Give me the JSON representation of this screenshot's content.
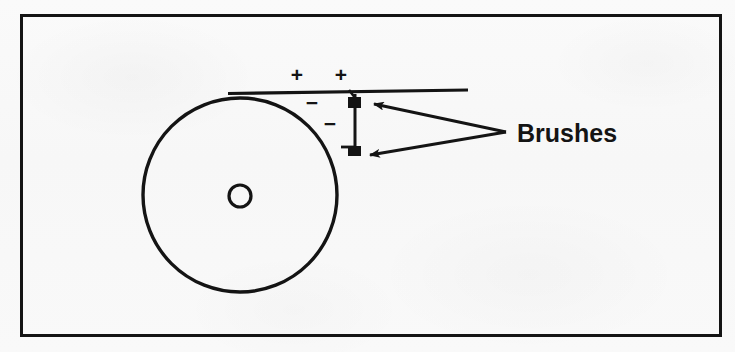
{
  "figure": {
    "kind": "technical-line-drawing",
    "background_color": "#f8f8f8",
    "ink_color": "#141414",
    "frame": {
      "name": "figure-border",
      "x": 20,
      "y": 14,
      "width": 702,
      "height": 323,
      "stroke_width": 3
    },
    "disc": {
      "label": "rotating-disc",
      "center_x": 240,
      "center_y": 195,
      "radius": 97,
      "stroke_width": 3
    },
    "shaft": {
      "label": "shaft-hole",
      "center_x": 240,
      "center_y": 196,
      "radius": 11,
      "stroke_width": 3
    },
    "conductor": {
      "label": "horizontal-conductor-bar",
      "x1": 231,
      "y1": 92,
      "x2": 468,
      "y2": 90,
      "stroke_width": 3
    },
    "brush_rod": {
      "label": "brush-connecting-rod",
      "x1": 355,
      "y1": 94,
      "x2": 355,
      "y2": 152,
      "stroke_width": 3
    },
    "brush_contacts": [
      {
        "label": "upper-brush-contact",
        "x": 348,
        "y": 97,
        "width": 13,
        "height": 11
      },
      {
        "label": "lower-brush-contact",
        "x": 348,
        "y": 146,
        "width": 13,
        "height": 10
      }
    ],
    "leaders": [
      {
        "label": "leader-to-upper-brush",
        "from_x": 506,
        "from_y": 132,
        "to_x": 372,
        "to_y": 104,
        "stroke_width": 3
      },
      {
        "label": "leader-to-lower-brush",
        "from_x": 506,
        "from_y": 132,
        "to_x": 368,
        "to_y": 155,
        "stroke_width": 3
      }
    ],
    "polarity_marks": [
      {
        "sign": "+",
        "x": 297,
        "y": 82
      },
      {
        "sign": "+",
        "x": 341,
        "y": 82
      },
      {
        "sign": "−",
        "x": 312,
        "y": 110
      },
      {
        "sign": "−",
        "x": 330,
        "y": 131
      }
    ],
    "annotation": {
      "text": "Brushes",
      "x": 517,
      "y": 142
    }
  }
}
